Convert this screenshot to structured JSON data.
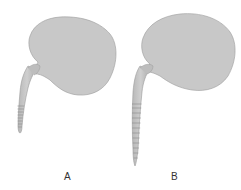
{
  "figure": {
    "panels": [
      {
        "id": "A",
        "label": "A",
        "tail_segments": 8
      },
      {
        "id": "B",
        "label": "B",
        "tail_segments": 12
      }
    ],
    "colors": {
      "body_fill": "#c8c8c8",
      "body_stroke": "#9a9a9a",
      "segment_line": "#8a8a8a",
      "background": "#ffffff"
    }
  }
}
